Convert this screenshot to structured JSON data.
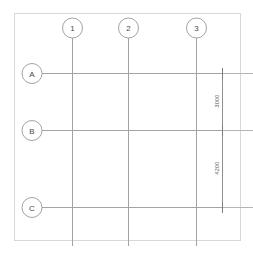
{
  "drawing": {
    "title": "Structural Grid Plan",
    "type": "architectural-grid-plan",
    "background_color": "#ffffff",
    "line_color": "#a3a3a3",
    "border_color": "#d8d8d8",
    "dimension_color": "#8f8f8f",
    "text_color": "#4a4a4a"
  },
  "sheet": {
    "border": {
      "x": 14,
      "y": 13,
      "width": 226,
      "height": 227
    }
  },
  "column_grid": {
    "axis": "vertical",
    "bubble_cy": 28,
    "bubble_r": 10,
    "line_top": 38,
    "line_bottom": 246,
    "bubbles": [
      {
        "label": "1",
        "x": 72
      },
      {
        "label": "2",
        "x": 128
      },
      {
        "label": "3",
        "x": 196
      }
    ]
  },
  "row_grid": {
    "axis": "horizontal",
    "bubble_cx": 32,
    "bubble_r": 10,
    "line_left": 42,
    "line_right": 253,
    "bubbles": [
      {
        "label": "A",
        "y": 73
      },
      {
        "label": "B",
        "y": 130
      },
      {
        "label": "C",
        "y": 207
      }
    ]
  },
  "dimensions": {
    "line_x": 222,
    "unit": "mm",
    "ticks": [
      73,
      130,
      207
    ],
    "entries": [
      {
        "value": "3000",
        "from_label": "A",
        "to_label": "B",
        "y_start": 73,
        "y_end": 130,
        "text_y": 101
      },
      {
        "value": "4200",
        "from_label": "B",
        "to_label": "C",
        "y_start": 130,
        "y_end": 207,
        "text_y": 168
      }
    ]
  }
}
